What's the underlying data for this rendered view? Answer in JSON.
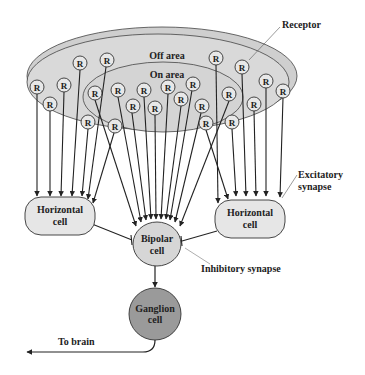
{
  "diagram": {
    "labels": {
      "receptor": "Receptor",
      "off_area": "Off area",
      "on_area": "On area",
      "excitatory_synapse_line1": "Excitatory",
      "excitatory_synapse_line2": "synapse",
      "inhibitory_synapse": "Inhibitory synapse",
      "to_brain": "To brain"
    },
    "receptor_glyph": "R",
    "cells": {
      "horizontal_left": {
        "line1": "Horizontal",
        "line2": "cell"
      },
      "horizontal_right": {
        "line1": "Horizontal",
        "line2": "cell"
      },
      "bipolar": {
        "line1": "Bipolar",
        "line2": "cell"
      },
      "ganglion": {
        "line1": "Ganglion",
        "line2": "cell"
      }
    },
    "colors": {
      "field_fill": "#d9d9d9",
      "cell_fill": "#e6e6e6",
      "bipolar_fill": "#d6d6d6",
      "ganglion_fill": "#9a9a9a",
      "stroke": "#222222"
    }
  }
}
